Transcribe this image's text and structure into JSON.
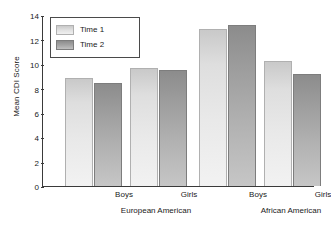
{
  "chart_data": {
    "type": "bar",
    "title": "",
    "xlabel": "",
    "ylabel": "Mean CDI Score",
    "ylim": [
      0,
      14
    ],
    "ytick_labels": [
      "14",
      "12",
      "10",
      "8",
      "6",
      "4",
      "2",
      "0"
    ],
    "ytick_values": [
      14,
      12,
      10,
      8,
      6,
      4,
      2,
      0
    ],
    "grid": false,
    "legend_position": "top-left",
    "categories": [
      "Boys",
      "Girls",
      "Boys",
      "Girls"
    ],
    "group_labels": [
      "European American",
      "African American"
    ],
    "series": [
      {
        "name": "Time 1",
        "color": "#e2e2e2",
        "values": [
          8.85,
          9.7,
          12.85,
          10.2
        ]
      },
      {
        "name": "Time 2",
        "color": "#a0a0a0",
        "values": [
          8.4,
          9.5,
          13.15,
          9.2
        ]
      }
    ],
    "groups": [
      {
        "group_label": "European American",
        "bars": [
          {
            "category": "Boys",
            "series": "Time 1",
            "value": 8.85
          },
          {
            "category": "Boys",
            "series": "Time 2",
            "value": 8.4
          },
          {
            "category": "Girls",
            "series": "Time 1",
            "value": 9.7
          },
          {
            "category": "Girls",
            "series": "Time 2",
            "value": 9.5
          }
        ]
      },
      {
        "group_label": "African American",
        "bars": [
          {
            "category": "Boys",
            "series": "Time 1",
            "value": 12.85
          },
          {
            "category": "Boys",
            "series": "Time 2",
            "value": 13.15
          },
          {
            "category": "Girls",
            "series": "Time 1",
            "value": 10.2
          },
          {
            "category": "Girls",
            "series": "Time 2",
            "value": 9.2
          }
        ]
      }
    ]
  },
  "axis": {
    "y_title": "Mean CDI Score",
    "ticks": [
      {
        "label": "14",
        "value": 14
      },
      {
        "label": "12",
        "value": 12
      },
      {
        "label": "10",
        "value": 10
      },
      {
        "label": "8",
        "value": 8
      },
      {
        "label": "6",
        "value": 6
      },
      {
        "label": "4",
        "value": 4
      },
      {
        "label": "2",
        "value": 2
      },
      {
        "label": "0",
        "value": 0
      }
    ]
  },
  "legend": {
    "items": [
      {
        "label": "Time 1",
        "key": "time1"
      },
      {
        "label": "Time 2",
        "key": "time2"
      }
    ]
  },
  "x_axis": {
    "sub_labels": [
      {
        "label": "Boys",
        "center": 82
      },
      {
        "label": "Girls",
        "center": 147
      },
      {
        "label": "Boys",
        "center": 216
      },
      {
        "label": "Girls",
        "center": 281
      }
    ],
    "group_labels": [
      {
        "label": "European American",
        "center": 114
      },
      {
        "label": "African American",
        "center": 249
      }
    ]
  },
  "bars": [
    {
      "name": "ea-boys-time1",
      "series": "time1",
      "value": 8.85,
      "left": 22,
      "width": 28
    },
    {
      "name": "ea-boys-time2",
      "series": "time2",
      "value": 8.4,
      "left": 51,
      "width": 28
    },
    {
      "name": "ea-girls-time1",
      "series": "time1",
      "value": 9.7,
      "left": 87,
      "width": 28
    },
    {
      "name": "ea-girls-time2",
      "series": "time2",
      "value": 9.5,
      "left": 116,
      "width": 28
    },
    {
      "name": "aa-boys-time1",
      "series": "time1",
      "value": 12.85,
      "left": 156,
      "width": 28
    },
    {
      "name": "aa-boys-time2",
      "series": "time2",
      "value": 13.15,
      "left": 185,
      "width": 28
    },
    {
      "name": "aa-girls-time1",
      "series": "time1",
      "value": 10.2,
      "left": 221,
      "width": 28
    },
    {
      "name": "aa-girls-time2",
      "series": "time2",
      "value": 9.2,
      "left": 250,
      "width": 28
    }
  ]
}
